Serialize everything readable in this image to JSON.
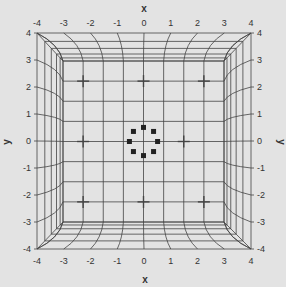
{
  "figure": {
    "background": "#e3e3e3",
    "line_color": "#444444",
    "axis_labels": {
      "top": "x",
      "bottom": "x",
      "left": "y",
      "right": "y"
    },
    "ticks": [
      "-4",
      "-3",
      "-2",
      "-1",
      "0",
      "1",
      "2",
      "3",
      "4"
    ]
  },
  "markers": {
    "plus_positions": [
      [
        -3,
        3
      ],
      [
        0,
        3
      ],
      [
        3,
        3
      ],
      [
        -3,
        0
      ],
      [
        2,
        0
      ],
      [
        -3,
        -3
      ],
      [
        0,
        -3
      ],
      [
        3,
        -3
      ]
    ],
    "square_ring": [
      [
        0,
        0.7
      ],
      [
        0.5,
        0.5
      ],
      [
        0.7,
        0
      ],
      [
        0.5,
        -0.5
      ],
      [
        0,
        -0.7
      ],
      [
        -0.5,
        -0.5
      ],
      [
        -0.7,
        0
      ],
      [
        -0.5,
        0.5
      ]
    ]
  }
}
